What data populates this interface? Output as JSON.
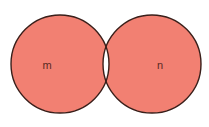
{
  "diagram": {
    "type": "venn",
    "colors": {
      "fill": "#f28072",
      "stroke": "#3a1f1a",
      "intersection": "#ffffff",
      "background": "#ffffff"
    },
    "sets": [
      {
        "label": "m",
        "cx": 60,
        "cy": 64,
        "r": 49,
        "label_x": 47,
        "label_y": 69
      },
      {
        "label": "n",
        "cx": 152,
        "cy": 64,
        "r": 49,
        "label_x": 160,
        "label_y": 69
      }
    ]
  }
}
